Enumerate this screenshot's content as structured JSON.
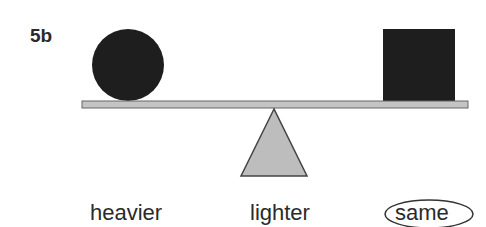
{
  "problem": {
    "label": "5b"
  },
  "balance": {
    "left_object": "circle",
    "right_object": "square",
    "beam_state": "level"
  },
  "options": [
    {
      "label": "heavier",
      "selected": false
    },
    {
      "label": "lighter",
      "selected": false
    },
    {
      "label": "same",
      "selected": true
    }
  ],
  "colors": {
    "object": "#1e1e1e",
    "beam": "#c4c4c4",
    "fulcrum": "#bdbdbd",
    "outline": "#444444"
  }
}
